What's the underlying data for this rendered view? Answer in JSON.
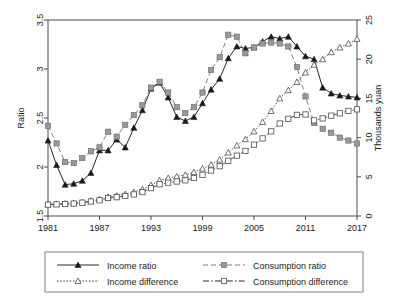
{
  "chart_data": {
    "type": "line",
    "title": "",
    "xlabel": "",
    "ylabel": "Ratio",
    "y2label": "Thousands yuan",
    "xlim": [
      1981,
      2017
    ],
    "ylim": [
      1.5,
      3.5
    ],
    "y2lim": [
      0,
      25
    ],
    "grid": false,
    "legend_position": "bottom",
    "xticks": [
      "1981",
      "1987",
      "1993",
      "1999",
      "2005",
      "2011",
      "2017"
    ],
    "xtick_values": [
      1981,
      1987,
      1993,
      1999,
      2005,
      2011,
      2017
    ],
    "yticks": [
      "1.5",
      "2",
      "2.5",
      "3",
      "3.5"
    ],
    "ytick_values": [
      1.5,
      2,
      2.5,
      3,
      3.5
    ],
    "y2ticks": [
      "0",
      "5",
      "10",
      "15",
      "20",
      "25"
    ],
    "y2tick_values": [
      0,
      5,
      10,
      15,
      20,
      25
    ],
    "x": [
      1981,
      1982,
      1983,
      1984,
      1985,
      1986,
      1987,
      1988,
      1989,
      1990,
      1991,
      1992,
      1993,
      1994,
      1995,
      1996,
      1997,
      1998,
      1999,
      2000,
      2001,
      2002,
      2003,
      2004,
      2005,
      2006,
      2007,
      2008,
      2009,
      2010,
      2011,
      2012,
      2013,
      2014,
      2015,
      2016,
      2017
    ],
    "series": [
      {
        "name": "Income ratio",
        "axis": "left",
        "units": "ratio",
        "marker": "filled-triangle",
        "linestyle": "solid",
        "color": "#1a1a1a",
        "values": [
          2.27,
          2.02,
          1.82,
          1.83,
          1.86,
          1.94,
          2.17,
          2.17,
          2.28,
          2.2,
          2.4,
          2.58,
          2.8,
          2.86,
          2.71,
          2.51,
          2.47,
          2.51,
          2.65,
          2.79,
          2.9,
          3.11,
          3.23,
          3.21,
          3.22,
          3.28,
          3.33,
          3.31,
          3.33,
          3.23,
          3.13,
          3.1,
          2.81,
          2.75,
          2.73,
          2.72,
          2.71
        ]
      },
      {
        "name": "Consumption ratio",
        "axis": "left",
        "units": "ratio",
        "marker": "filled-square",
        "linestyle": "dashed",
        "color": "#999999",
        "values": [
          2.42,
          2.24,
          2.05,
          2.04,
          2.09,
          2.16,
          2.2,
          2.36,
          2.31,
          2.43,
          2.53,
          2.63,
          2.81,
          2.87,
          2.76,
          2.61,
          2.55,
          2.61,
          2.76,
          2.99,
          3.12,
          3.35,
          3.33,
          3.16,
          3.22,
          3.26,
          3.27,
          3.26,
          3.23,
          3.02,
          2.72,
          2.45,
          2.39,
          2.35,
          2.3,
          2.27,
          2.24
        ]
      },
      {
        "name": "Income difference",
        "axis": "right",
        "units": "thousands yuan",
        "marker": "open-triangle",
        "linestyle": "dotted",
        "color": "#4d4d4d",
        "values": [
          1.52,
          1.55,
          1.6,
          1.65,
          1.75,
          1.95,
          2.15,
          2.45,
          2.6,
          2.8,
          3.05,
          3.4,
          3.95,
          4.55,
          4.85,
          5.05,
          5.25,
          5.6,
          6.05,
          6.55,
          7.2,
          8.1,
          9.0,
          9.8,
          10.8,
          12.0,
          13.4,
          15.0,
          16.05,
          17.1,
          18.3,
          19.3,
          20.0,
          20.9,
          21.5,
          22.0,
          22.6
        ]
      },
      {
        "name": "Consumption difference",
        "axis": "right",
        "units": "thousands yuan",
        "marker": "open-square",
        "linestyle": "dash-dot",
        "color": "#4d4d4d",
        "values": [
          1.45,
          1.48,
          1.53,
          1.58,
          1.7,
          1.85,
          2.0,
          2.3,
          2.4,
          2.55,
          2.75,
          3.05,
          3.55,
          4.05,
          4.25,
          4.4,
          4.55,
          4.85,
          5.25,
          5.8,
          6.35,
          7.05,
          7.7,
          8.3,
          9.1,
          9.9,
          10.8,
          11.8,
          12.4,
          12.9,
          12.95,
          12.2,
          12.45,
          12.8,
          13.1,
          13.4,
          13.6
        ]
      }
    ]
  },
  "legend": {
    "entries": [
      {
        "label": "Income ratio",
        "marker": "filled-triangle",
        "linestyle": "solid"
      },
      {
        "label": "Consumption ratio",
        "marker": "filled-square",
        "linestyle": "dashed"
      },
      {
        "label": "Income difference",
        "marker": "open-triangle",
        "linestyle": "dotted"
      },
      {
        "label": "Consumption difference",
        "marker": "open-square",
        "linestyle": "dash-dot"
      }
    ]
  },
  "colors": {
    "dark": "#1a1a1a",
    "grey_marker": "#999999",
    "axis": "#4d4d4d",
    "background": "#ffffff"
  }
}
